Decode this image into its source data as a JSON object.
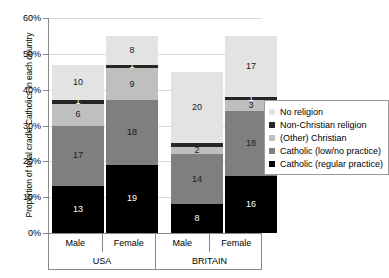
{
  "chart_data": {
    "type": "bar",
    "subtype": "stacked-bar",
    "title": "",
    "xlabel": "",
    "ylabel": "Proportion of total cradle Catholics in each country",
    "ylim": [
      0,
      60
    ],
    "ytick_labels": [
      "0%",
      "10%",
      "20%",
      "30%",
      "40%",
      "50%",
      "60%"
    ],
    "ytick_values": [
      0,
      10,
      20,
      30,
      40,
      50,
      60
    ],
    "grid": true,
    "grid_axis": "y",
    "legend_position": "right",
    "categories": [
      "Male",
      "Female",
      "Male",
      "Female"
    ],
    "groups": [
      {
        "label": "USA",
        "categories": [
          "Male",
          "Female"
        ]
      },
      {
        "label": "BRITAIN",
        "categories": [
          "Male",
          "Female"
        ]
      }
    ],
    "series": [
      {
        "name": "Catholic (regular practice)",
        "color": "#000000",
        "values": [
          13,
          19,
          8,
          16
        ]
      },
      {
        "name": "Catholic (low/no practice)",
        "color": "#7f7f7f",
        "values": [
          17,
          18,
          14,
          18
        ]
      },
      {
        "name": "(Other) Christian",
        "color": "#bfbfbf",
        "values": [
          6,
          9,
          2,
          3
        ]
      },
      {
        "name": "Non-Christian religion",
        "color": "#262626",
        "values": [
          1,
          1,
          1,
          1
        ]
      },
      {
        "name": "No religion",
        "color": "#e3e3e3",
        "values": [
          10,
          8,
          20,
          17
        ]
      }
    ],
    "bar_totals": [
      47,
      55,
      45,
      55
    ]
  },
  "axis": {
    "y_title": "Proportion of total cradle Catholics in each country",
    "ticks": [
      {
        "label": "60%",
        "value": 60
      },
      {
        "label": "50%",
        "value": 50
      },
      {
        "label": "40%",
        "value": 40
      },
      {
        "label": "30%",
        "value": 30
      },
      {
        "label": "20%",
        "value": 20
      },
      {
        "label": "10%",
        "value": 10
      },
      {
        "label": "0%",
        "value": 0
      }
    ]
  },
  "categories_axis": {
    "cells": [
      "Male",
      "Female",
      "",
      "Male",
      "Female"
    ],
    "groups": [
      "USA",
      "",
      "BRITAIN"
    ]
  },
  "legend": {
    "items": [
      {
        "label": "No religion",
        "color": "#e3e3e3"
      },
      {
        "label": "Non-Christian religion",
        "color": "#262626"
      },
      {
        "label": "(Other) Christian",
        "color": "#bfbfbf"
      },
      {
        "label": "Catholic (low/no practice)",
        "color": "#7f7f7f"
      },
      {
        "label": "Catholic (regular practice)",
        "color": "#000000"
      }
    ]
  },
  "bars": [
    {
      "group": "USA",
      "category": "Male",
      "segments": [
        {
          "series": "Catholic (regular practice)",
          "value": 13,
          "label": "13"
        },
        {
          "series": "Catholic (low/no practice)",
          "value": 17,
          "label": "17"
        },
        {
          "series": "(Other) Christian",
          "value": 6,
          "label": "6"
        },
        {
          "series": "Non-Christian religion",
          "value": 1,
          "label": "1"
        },
        {
          "series": "No religion",
          "value": 10,
          "label": "10"
        }
      ]
    },
    {
      "group": "USA",
      "category": "Female",
      "segments": [
        {
          "series": "Catholic (regular practice)",
          "value": 19,
          "label": "19"
        },
        {
          "series": "Catholic (low/no practice)",
          "value": 18,
          "label": "18"
        },
        {
          "series": "(Other) Christian",
          "value": 9,
          "label": "9"
        },
        {
          "series": "Non-Christian religion",
          "value": 1,
          "label": "1"
        },
        {
          "series": "No religion",
          "value": 8,
          "label": "8"
        }
      ]
    },
    {
      "group": "BRITAIN",
      "category": "Male",
      "segments": [
        {
          "series": "Catholic (regular practice)",
          "value": 8,
          "label": "8"
        },
        {
          "series": "Catholic (low/no practice)",
          "value": 14,
          "label": "14"
        },
        {
          "series": "(Other) Christian",
          "value": 2,
          "label": "2"
        },
        {
          "series": "Non-Christian religion",
          "value": 1,
          "label": ""
        },
        {
          "series": "No religion",
          "value": 20,
          "label": "20"
        }
      ]
    },
    {
      "group": "BRITAIN",
      "category": "Female",
      "segments": [
        {
          "series": "Catholic (regular practice)",
          "value": 16,
          "label": "16"
        },
        {
          "series": "Catholic (low/no practice)",
          "value": 18,
          "label": "18"
        },
        {
          "series": "(Other) Christian",
          "value": 3,
          "label": "3"
        },
        {
          "series": "Non-Christian religion",
          "value": 1,
          "label": "1"
        },
        {
          "series": "No religion",
          "value": 17,
          "label": "17"
        }
      ]
    }
  ]
}
